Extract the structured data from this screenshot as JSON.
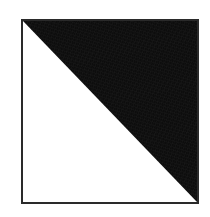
{
  "figure": {
    "title": "",
    "caption": "",
    "background_color": "#ffffff"
  },
  "shape": {
    "type": "square",
    "name": "half-filled-square",
    "border_color": "#2a2a2a",
    "border_width_px": 2,
    "fill_color": "#ffffff",
    "left_px": 21,
    "top_px": 19,
    "width_px": 178,
    "height_px": 185
  },
  "triangle": {
    "name": "upper-right-triangle",
    "fill_color": "#0d0d0d",
    "orientation": "upper-right",
    "diagonal_from": "top-left",
    "diagonal_to": "bottom-right",
    "points": "0,0 100,0 100,100",
    "texture": "scan-noise"
  }
}
